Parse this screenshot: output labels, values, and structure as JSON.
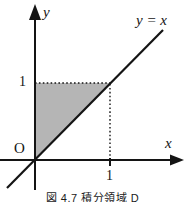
{
  "figure": {
    "caption": "図 4.7 積分領域 D",
    "labels": {
      "y_axis": "y",
      "x_axis": "x",
      "line_equation": "y = x",
      "origin": "O",
      "y_tick_1": "1",
      "x_tick_1": "1"
    },
    "colors": {
      "region_fill": "#b5b5b5",
      "line_color": "#141414",
      "background": "#ffffff"
    }
  }
}
